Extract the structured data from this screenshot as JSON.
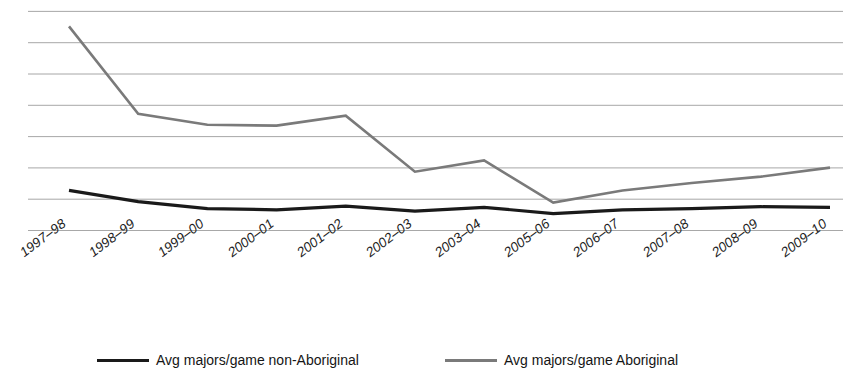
{
  "chart_data": {
    "type": "line",
    "title": "",
    "xlabel": "",
    "ylabel": "",
    "grid": true,
    "gridlines": 8,
    "legend_position": "bottom",
    "ylim": [
      0,
      7
    ],
    "categories": [
      "1997–98",
      "1998–99",
      "1999–00",
      "2000–01",
      "2001–02",
      "2002–03",
      "2003–04",
      "2005–06",
      "2006–07",
      "2007–08",
      "2008–09",
      "2009–10"
    ],
    "series": [
      {
        "name": "Avg majors/game non-Aboriginal",
        "color": "#1a1a1a",
        "stroke_width": 3.2,
        "values": [
          1.28,
          0.92,
          0.7,
          0.66,
          0.78,
          0.62,
          0.74,
          0.54,
          0.66,
          0.7,
          0.76,
          0.74
        ]
      },
      {
        "name": "Avg majors/game Aboriginal",
        "color": "#7a7a7a",
        "stroke_width": 2.6,
        "values": [
          6.52,
          3.73,
          3.38,
          3.35,
          3.67,
          1.88,
          2.24,
          0.89,
          1.28,
          1.52,
          1.72,
          2.01
        ]
      }
    ]
  },
  "legend": {
    "entries": [
      {
        "label": "Avg majors/game non-Aboriginal"
      },
      {
        "label": "Avg majors/game Aboriginal"
      }
    ]
  }
}
